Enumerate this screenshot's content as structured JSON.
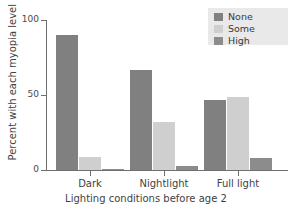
{
  "chart_data": {
    "type": "bar",
    "title": "",
    "subtitle": "",
    "xlabel": "Lighting conditions before age 2",
    "ylabel": "Percent with each myopia level",
    "categories": [
      "Dark",
      "Nightlight",
      "Full light"
    ],
    "series": [
      {
        "name": "None",
        "values": [
          90,
          67,
          47
        ],
        "color": "#808080"
      },
      {
        "name": "Some",
        "values": [
          9,
          32,
          49
        ],
        "color": "#cfcfcf"
      },
      {
        "name": "High",
        "values": [
          1,
          3,
          8
        ],
        "color": "#8c8c8c"
      }
    ],
    "ylim": [
      0,
      100
    ],
    "yticks": [
      0,
      50,
      100
    ],
    "ytick_labels": [
      "0",
      "50",
      "100"
    ],
    "grid": false,
    "legend_position": "top-right",
    "legend_entries": [
      "None",
      "Some",
      "High"
    ]
  },
  "legend": {
    "items": [
      {
        "label": "None",
        "color": "#808080"
      },
      {
        "label": "Some",
        "color": "#cfcfcf"
      },
      {
        "label": "High",
        "color": "#8c8c8c"
      }
    ],
    "background": "#e9e9e9"
  },
  "axes": {
    "y_title": "Percent with each myopia level",
    "x_title": "Lighting conditions before age 2",
    "y_tick_labels": [
      "100",
      "50",
      "0"
    ],
    "x_tick_labels": [
      "Dark",
      "Nightlight",
      "Full light"
    ]
  },
  "colors": {
    "axis": "#6f6f6f",
    "text": "#3f3f3f",
    "background": "#ffffff"
  }
}
